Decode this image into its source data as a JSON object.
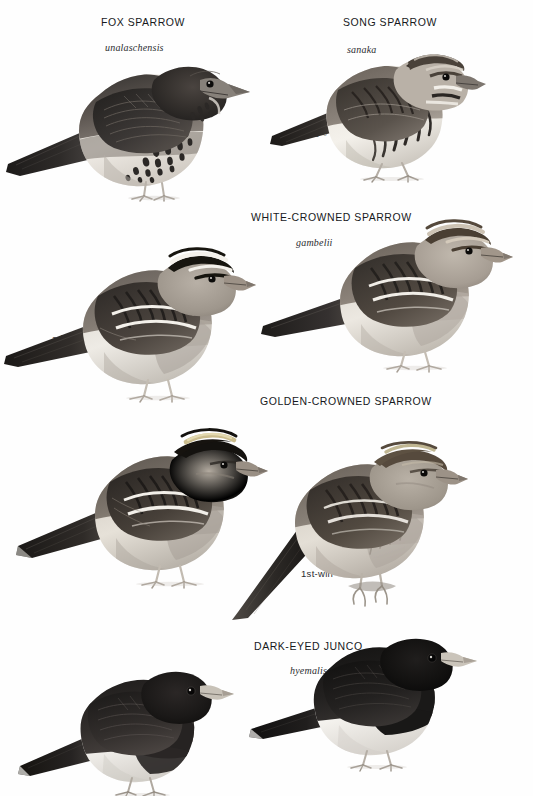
{
  "page": {
    "kind": "field-guide-plate",
    "background_color": "#fefefe",
    "text_color": "#17191c"
  },
  "species": [
    {
      "id": "fox-sparrow",
      "title": "FOX SPARROW",
      "subspecies": "unalaschensis",
      "title_pos": {
        "x": 101,
        "y": 16
      },
      "sub_pos": {
        "x": 105,
        "y": 42
      },
      "figures": [
        {
          "id": "fox-sparrow-ad",
          "age_label": "ad",
          "label_pos": {
            "x": 72,
            "y": 139
          },
          "bird_pos": {
            "x": 4,
            "y": 36
          },
          "scale": 1.0,
          "plumage": "dark-sooty-heavy-spotted"
        }
      ]
    },
    {
      "id": "song-sparrow",
      "title": "SONG SPARROW",
      "subspecies": "sanaka",
      "title_pos": {
        "x": 343,
        "y": 16
      },
      "sub_pos": {
        "x": 347,
        "y": 44
      },
      "figures": [
        {
          "id": "song-sparrow-ad-male",
          "age_label": "ad ♂",
          "label_pos": {
            "x": 308,
            "y": 128
          },
          "bird_pos": {
            "x": 268,
            "y": 32
          },
          "scale": 0.82,
          "plumage": "streaked-brown-malar"
        }
      ]
    },
    {
      "id": "white-crowned-sparrow",
      "title": "WHITE-CROWNED SPARROW",
      "subspecies": "gambelii",
      "title_pos": {
        "x": 251,
        "y": 211
      },
      "sub_pos": {
        "x": 296,
        "y": 237
      },
      "figures": [
        {
          "id": "white-crowned-ad-sum",
          "age_label": "ad sum",
          "label_pos": {
            "x": 52,
            "y": 333
          },
          "bird_pos": {
            "x": 0,
            "y": 228
          },
          "scale": 0.95,
          "plumage": "black-white-crown"
        },
        {
          "id": "white-crowned-1st-win",
          "age_label": "1st-win",
          "label_pos": {
            "x": 307,
            "y": 308
          },
          "bird_pos": {
            "x": 257,
            "y": 200
          },
          "scale": 0.95,
          "plumage": "brown-buff-crown"
        }
      ]
    },
    {
      "id": "golden-crowned-sparrow",
      "title": "GOLDEN-CROWNED SPARROW",
      "subspecies": "",
      "title_pos": {
        "x": 260,
        "y": 395
      },
      "sub_pos": {
        "x": 0,
        "y": 0
      },
      "figures": [
        {
          "id": "golden-crowned-ad-male",
          "age_label": "ad ♂",
          "label_pos": {
            "x": 78,
            "y": 528
          },
          "bird_pos": {
            "x": 10,
            "y": 412
          },
          "scale": 1.0,
          "plumage": "black-crown-gold-center"
        },
        {
          "id": "golden-crowned-1st-win",
          "age_label": "1st-win",
          "label_pos": {
            "x": 301,
            "y": 568
          },
          "bird_pos": {
            "x": 230,
            "y": 430
          },
          "scale": 1.0,
          "plumage": "dull-brown-crown"
        }
      ]
    },
    {
      "id": "dark-eyed-junco",
      "title": "DARK-EYED JUNCO",
      "subspecies": "hyemalis",
      "title_pos": {
        "x": 254,
        "y": 640
      },
      "sub_pos": {
        "x": 290,
        "y": 665
      },
      "figures": [
        {
          "id": "junco-1st-win",
          "age_label": "1st-win",
          "label_pos": {
            "x": 70,
            "y": 745
          },
          "bird_pos": {
            "x": 14,
            "y": 650
          },
          "scale": 0.78,
          "plumage": "blackish-hood-white-belly"
        },
        {
          "id": "junco-ad-male",
          "age_label": "ad ♂",
          "label_pos": {
            "x": 301,
            "y": 709
          },
          "bird_pos": {
            "x": 245,
            "y": 615
          },
          "scale": 0.78,
          "plumage": "black-hood-white-belly"
        }
      ]
    }
  ]
}
